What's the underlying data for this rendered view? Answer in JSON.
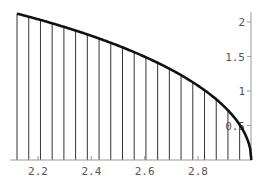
{
  "chart_data": {
    "type": "line",
    "title": "",
    "xlabel": "",
    "ylabel": "",
    "function": "y = sqrt(9 - x^2)",
    "xlim": [
      2.1213,
      3.0
    ],
    "ylim": [
      0,
      2.12
    ],
    "grid": false,
    "legend": null,
    "x_ticks": [
      2.2,
      2.4,
      2.6,
      2.8
    ],
    "x_tick_labels": [
      "2.2",
      "2.4",
      "2.6",
      "2.8"
    ],
    "y_ticks": [
      0.5,
      1,
      1.5,
      2
    ],
    "y_tick_labels": [
      "0.5",
      "1",
      "1.5",
      "2"
    ],
    "y_axis_position": "right (at x = 3)",
    "vertical_lines": {
      "count": 21,
      "x": [
        2.1213,
        2.1653,
        2.2092,
        2.2531,
        2.2971,
        2.341,
        2.385,
        2.4289,
        2.4728,
        2.5168,
        2.5607,
        2.6046,
        2.6486,
        2.6925,
        2.7364,
        2.7804,
        2.8243,
        2.8683,
        2.9122,
        2.9561,
        3.0
      ],
      "y": [
        2.1213,
        2.0582,
        1.9919,
        1.922,
        1.8481,
        1.7697,
        1.6861,
        1.5963,
        1.4992,
        1.3929,
        1.2749,
        1.1409,
        0.9834,
        0.787,
        0.5092,
        0.0,
        0,
        0,
        0,
        0,
        0
      ]
    },
    "series": [
      {
        "name": "curve",
        "color": "#111111"
      }
    ]
  },
  "layout": {
    "x_pixel_at_2_2": 38,
    "px_per_unit_x": 266.7,
    "y_pixel_at_0": 160,
    "px_per_unit_y": 69
  }
}
